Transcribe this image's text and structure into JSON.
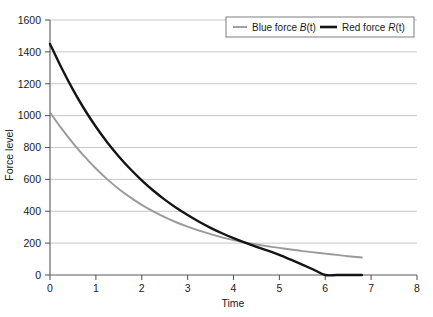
{
  "chart_data": {
    "type": "line",
    "title": "",
    "subtitle": "",
    "xlabel": "Time",
    "ylabel": "Force level",
    "xlim": [
      0,
      8
    ],
    "ylim": [
      0,
      1600
    ],
    "xticks": [
      "0",
      "1",
      "2",
      "3",
      "4",
      "5",
      "6",
      "7",
      "8"
    ],
    "yticks": [
      "0",
      "200",
      "400",
      "600",
      "800",
      "1000",
      "1200",
      "1400",
      "1600"
    ],
    "grid": "horizontal",
    "legend_position": "top-right",
    "series": [
      {
        "name": "Blue force B(t)",
        "label_plain": "Blue force ",
        "label_symbol": "B",
        "label_arg": "(t)",
        "color": "#9a9a9a",
        "x": [
          0.0,
          0.25,
          0.5,
          0.75,
          1.0,
          1.25,
          1.5,
          1.75,
          2.0,
          2.25,
          2.5,
          2.75,
          3.0,
          3.25,
          3.5,
          3.75,
          4.0,
          4.25,
          4.5,
          4.75,
          5.0,
          5.25,
          5.5,
          5.75,
          6.0,
          6.25,
          6.5,
          6.8
        ],
        "values": [
          1020,
          920,
          828,
          744,
          668,
          600,
          540,
          487,
          440,
          399,
          363,
          331,
          303,
          278,
          256,
          236,
          219,
          204,
          191,
          180,
          170,
          160,
          150,
          142,
          134,
          126,
          118,
          110
        ]
      },
      {
        "name": "Red force R(t)",
        "label_plain": "Red force ",
        "label_symbol": "R",
        "label_arg": "(t)",
        "color": "#141414",
        "x": [
          0.0,
          0.25,
          0.5,
          0.75,
          1.0,
          1.25,
          1.5,
          1.75,
          2.0,
          2.25,
          2.5,
          2.75,
          3.0,
          3.25,
          3.5,
          3.75,
          4.0,
          4.25,
          4.5,
          4.75,
          5.0,
          5.25,
          5.5,
          5.75,
          6.0,
          6.25,
          6.5,
          6.8
        ],
        "values": [
          1450,
          1300,
          1163,
          1040,
          930,
          832,
          744,
          665,
          594,
          530,
          473,
          422,
          376,
          334,
          296,
          262,
          231,
          203,
          177,
          153,
          126,
          96,
          65,
          33,
          0,
          0,
          0,
          0
        ]
      }
    ]
  },
  "legend": {
    "items": [
      {
        "label_plain": "Blue force ",
        "label_symbol": "B",
        "label_arg": "(t)"
      },
      {
        "label_plain": "Red force ",
        "label_symbol": "R",
        "label_arg": "(t)"
      }
    ]
  }
}
